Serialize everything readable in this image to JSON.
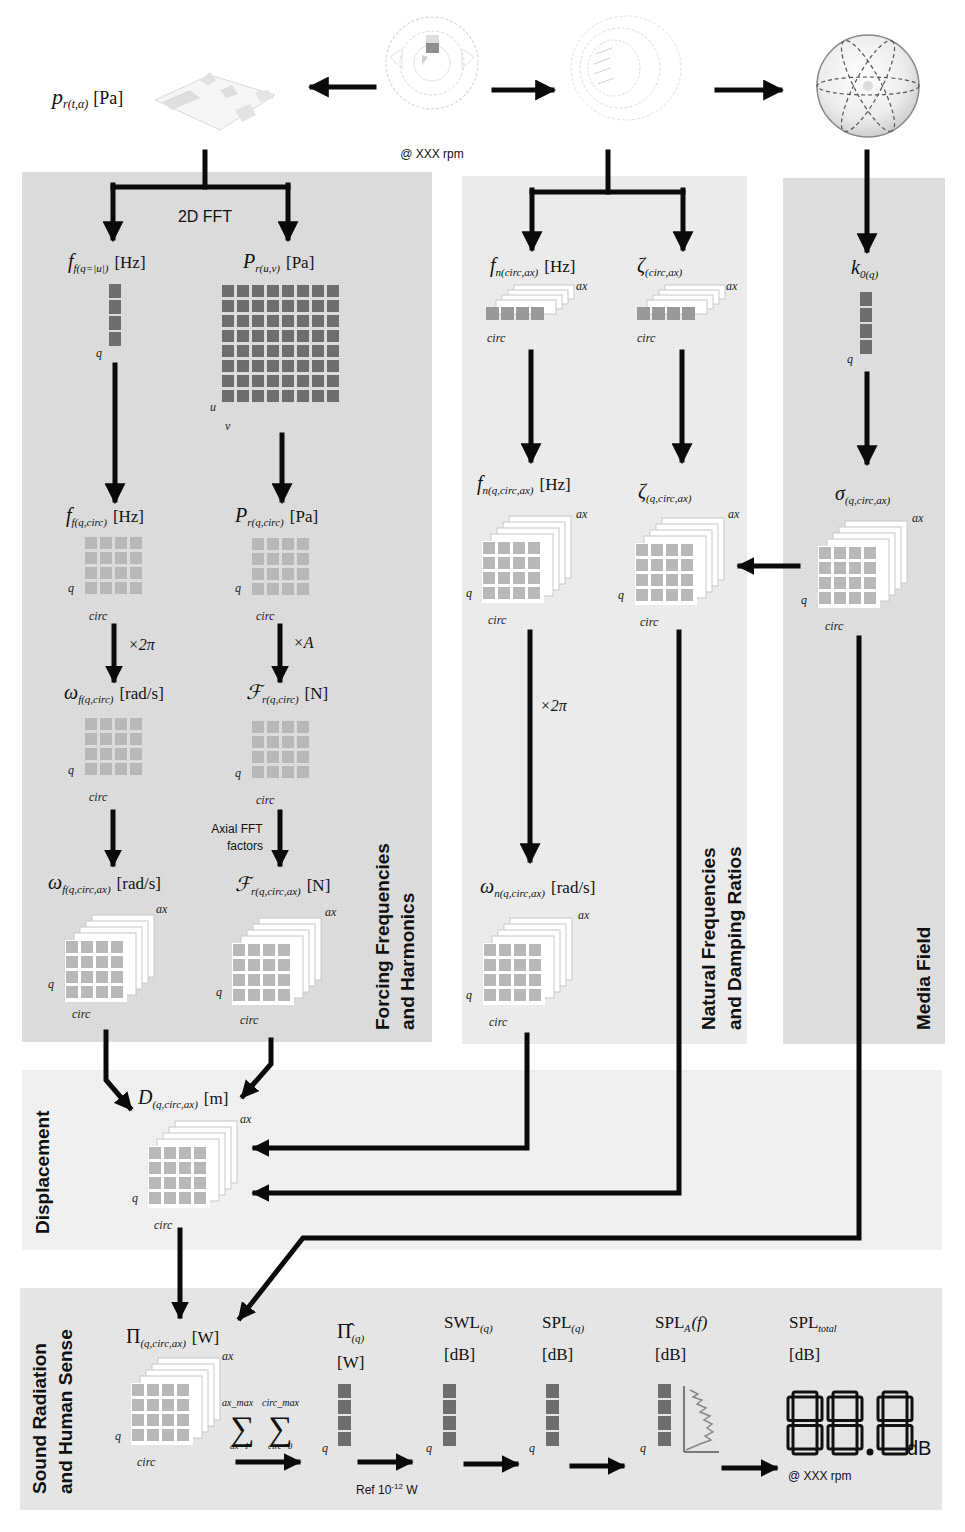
{
  "colors": {
    "panel_dark": "#dcdcdc",
    "panel_light": "#ececec",
    "panel_media": "#e0e0e0",
    "cell_dark": "#6e6e6e",
    "cell_light": "#b8b8b8",
    "arrow": "#0a0a0a"
  },
  "top_row": {
    "pressure_label": "p",
    "pressure_sub": "r(t,α)",
    "pressure_unit": "[Pa]",
    "motor_caption": "@ XXX rpm"
  },
  "panels": {
    "forcing": {
      "title_line1": "Forcing Frequencies",
      "title_line2": "and Harmonics",
      "fft_label": "2D FFT",
      "ff_q": {
        "sym": "f",
        "sub": "f(q=|u|)",
        "unit": "[Hz]",
        "axis": "q"
      },
      "pr_uv": {
        "sym": "P",
        "sub": "r(u,v)",
        "unit": "[Pa]",
        "axis_u": "u",
        "axis_v": "v"
      },
      "ff_qcirc": {
        "sym": "f",
        "sub": "f(q,circ)",
        "unit": "[Hz]",
        "axis_q": "q",
        "axis_circ": "circ"
      },
      "pr_qcirc": {
        "sym": "P",
        "sub": "r(q,circ)",
        "unit": "[Pa]",
        "axis_q": "q",
        "axis_circ": "circ"
      },
      "mult_2pi": "×2π",
      "mult_a": "×A",
      "wf_qcirc": {
        "sym": "ω",
        "sub": "f(q,circ)",
        "unit": "[rad/s]",
        "axis_q": "q",
        "axis_circ": "circ"
      },
      "fr_qcirc": {
        "sym": "ℱ",
        "sub": "r(q,circ)",
        "unit": "[N]",
        "axis_q": "q",
        "axis_circ": "circ"
      },
      "axial_fft_line1": "Axial FFT",
      "axial_fft_line2": "factors",
      "wf_qcircax": {
        "sym": "ω",
        "sub": "f(q,circ,ax)",
        "unit": "[rad/s]",
        "axis_q": "q",
        "axis_circ": "circ",
        "axis_ax": "ax"
      },
      "fr_qcircax": {
        "sym": "ℱ",
        "sub": "r(q,circ,ax)",
        "unit": "[N]",
        "axis_q": "q",
        "axis_circ": "circ",
        "axis_ax": "ax"
      }
    },
    "natural": {
      "title_line1": "Natural Frequencies",
      "title_line2": "and Damping Ratios",
      "fn_circax": {
        "sym": "f",
        "sub": "n(circ,ax)",
        "unit": "[Hz]",
        "axis_circ": "circ",
        "axis_ax": "ax"
      },
      "zeta_circax": {
        "sym": "ζ",
        "sub": "(circ,ax)",
        "axis_circ": "circ",
        "axis_ax": "ax"
      },
      "fn_qcircax": {
        "sym": "f",
        "sub": "n(q,circ,ax)",
        "unit": "[Hz]",
        "axis_q": "q",
        "axis_circ": "circ",
        "axis_ax": "ax"
      },
      "zeta_qcircax": {
        "sym": "ζ",
        "sub": "(q,circ,ax)",
        "axis_q": "q",
        "axis_circ": "circ",
        "axis_ax": "ax"
      },
      "mult_2pi": "×2π",
      "wn_qcircax": {
        "sym": "ω",
        "sub": "n(q,circ,ax)",
        "unit": "[rad/s]",
        "axis_q": "q",
        "axis_circ": "circ",
        "axis_ax": "ax"
      }
    },
    "media": {
      "title": "Media Field",
      "k0": {
        "sym": "k",
        "sub": "0(q)",
        "axis_q": "q"
      },
      "sigma": {
        "sym": "σ",
        "sub": "(q,circ,ax)",
        "axis_q": "q",
        "axis_circ": "circ",
        "axis_ax": "ax"
      }
    },
    "displacement": {
      "title": "Displacement",
      "d": {
        "sym": "D",
        "sub": "(q,circ,ax)",
        "unit": "[m]",
        "axis_q": "q",
        "axis_circ": "circ",
        "axis_ax": "ax"
      }
    },
    "sound": {
      "title_line1": "Sound Radiation",
      "title_line2": "and Human Sense",
      "pi": {
        "sym": "Π",
        "sub": "(q,circ,ax)",
        "unit": "[W]",
        "axis_q": "q",
        "axis_circ": "circ",
        "axis_ax": "ax"
      },
      "sum1": {
        "top": "ax_max",
        "bottom": "ax=1"
      },
      "sum2": {
        "top": "circ_max",
        "bottom": "circ=0"
      },
      "pi_hat": {
        "sym": "Π̂",
        "sub": "(q)",
        "unit": "[W]",
        "axis_q": "q"
      },
      "ref_label": "Ref 10",
      "ref_exp": "-12",
      "ref_unit": " W",
      "swl": {
        "sym": "SWL",
        "sub": "(q)",
        "unit": "[dB]",
        "axis_q": "q"
      },
      "spl": {
        "sym": "SPL",
        "sub": "(q)",
        "unit": "[dB]",
        "axis_q": "q"
      },
      "spl_a": {
        "sym": "SPL",
        "sub": "A",
        "arg": "(f)",
        "unit": "[dB]",
        "axis_q": "q"
      },
      "spl_total": {
        "sym": "SPL",
        "sub": "total",
        "unit": "[dB]"
      },
      "display_value": "88.8",
      "display_unit": "dB",
      "display_caption": "@ XXX rpm"
    }
  }
}
